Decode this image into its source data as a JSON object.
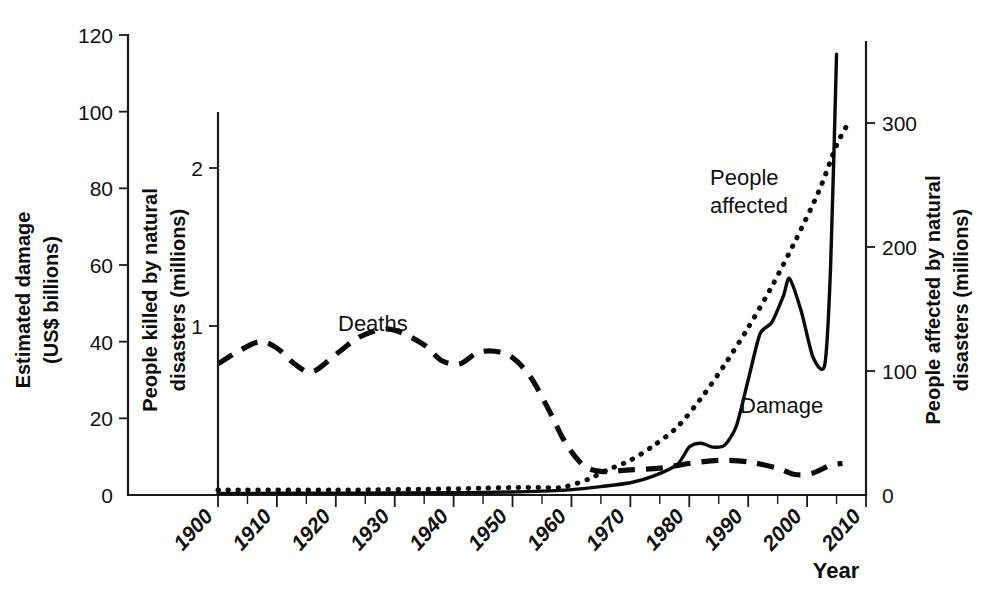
{
  "chart_data": {
    "type": "line",
    "title": "",
    "subtitle": "",
    "xlabel": "Year",
    "grid": false,
    "legend_position": "inline-annotations",
    "xlim": [
      1896,
      2012
    ],
    "x_ticks": [
      "1900",
      "1910",
      "1920",
      "1930",
      "1940",
      "1950",
      "1960",
      "1970",
      "1980",
      "1990",
      "2000",
      "2010"
    ],
    "x_tick_values": [
      1900,
      1910,
      1920,
      1930,
      1940,
      1950,
      1960,
      1970,
      1980,
      1990,
      2000,
      2010
    ],
    "x_minor_tick_step": 5,
    "axes": [
      {
        "id": "left",
        "label_line1": "Estimated damage",
        "label_line2": "(US$ billions)",
        "ticks": [
          "0",
          "20",
          "40",
          "60",
          "80",
          "100",
          "120"
        ],
        "tick_values": [
          0,
          20,
          40,
          60,
          80,
          100,
          120
        ],
        "ylim": [
          0,
          120
        ]
      },
      {
        "id": "middle",
        "label_line1": "People killed by natural",
        "label_line2": "disasters (millions)",
        "ticks": [
          "1",
          "2"
        ],
        "tick_values": [
          1,
          2
        ],
        "ylim": [
          0,
          2.4
        ]
      },
      {
        "id": "right",
        "label_line1": "People affected by natural",
        "label_line2": "disasters (millions)",
        "ticks": [
          "0",
          "100",
          "200",
          "300"
        ],
        "tick_values": [
          0,
          100,
          200,
          300
        ],
        "ylim": [
          0,
          360
        ]
      }
    ],
    "annotations": [
      {
        "name": "deaths-label",
        "text": "Deaths",
        "x": 1928,
        "y_axis": "middle",
        "y": 1.18
      },
      {
        "name": "people-affected-label",
        "text": "People",
        "x": 1983,
        "y_axis": "right",
        "y": 250
      },
      {
        "name": "people-affected-label-2",
        "text": "affected",
        "x": 1983,
        "y_axis": "right",
        "y": 232
      },
      {
        "name": "damage-label",
        "text": "Damage",
        "x": 1988,
        "y_axis": "left",
        "y": 28
      }
    ],
    "series": [
      {
        "name": "Deaths",
        "axis": "middle",
        "style": "dashed",
        "unit": "millions",
        "x": [
          1900,
          1903,
          1907,
          1910,
          1913,
          1916,
          1920,
          1924,
          1928,
          1931,
          1935,
          1938,
          1941,
          1944,
          1947,
          1950,
          1953,
          1956,
          1959,
          1962,
          1965,
          1970,
          1975,
          1980,
          1985,
          1990,
          1995,
          1998,
          2001,
          2004,
          2006
        ],
        "values": [
          0.76,
          0.83,
          0.9,
          0.86,
          0.76,
          0.71,
          0.82,
          0.93,
          0.98,
          0.96,
          0.88,
          0.78,
          0.76,
          0.83,
          0.84,
          0.8,
          0.68,
          0.48,
          0.26,
          0.12,
          0.08,
          0.09,
          0.1,
          0.13,
          0.15,
          0.14,
          0.1,
          0.06,
          0.07,
          0.12,
          0.13
        ]
      },
      {
        "name": "Damage",
        "axis": "left",
        "style": "solid",
        "unit": "US$ billions",
        "x": [
          1900,
          1920,
          1940,
          1950,
          1955,
          1960,
          1965,
          1970,
          1974,
          1978,
          1980,
          1982,
          1984,
          1986,
          1988,
          1990,
          1992,
          1994,
          1996,
          1997,
          1999,
          2001,
          2003,
          2004,
          2005
        ],
        "values": [
          0.4,
          0.5,
          0.6,
          0.8,
          1.0,
          1.4,
          2.2,
          3.2,
          5.0,
          8.0,
          12.5,
          13.5,
          12.5,
          13.0,
          18.0,
          30.0,
          42.0,
          45.0,
          52.0,
          56.5,
          48.0,
          36.0,
          34.0,
          60.0,
          115.0
        ]
      },
      {
        "name": "People affected",
        "axis": "right",
        "style": "dotted",
        "unit": "millions",
        "x": [
          1900,
          1920,
          1940,
          1950,
          1955,
          1958,
          1960,
          1963,
          1966,
          1970,
          1974,
          1978,
          1982,
          1986,
          1990,
          1994,
          1998,
          2002,
          2005,
          2007
        ],
        "values": [
          4,
          4,
          5,
          6,
          6,
          6,
          8,
          13,
          20,
          28,
          40,
          55,
          78,
          105,
          135,
          168,
          205,
          245,
          282,
          300
        ]
      }
    ]
  },
  "series_labels": {
    "deaths": "Deaths",
    "people_affected_line1": "People",
    "people_affected_line2": "affected",
    "damage": "Damage"
  },
  "colors": {
    "ink": "#0a0a0a",
    "background": "#ffffff"
  }
}
